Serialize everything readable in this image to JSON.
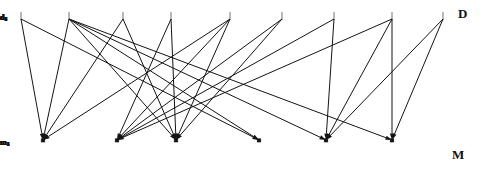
{
  "figure": {
    "type": "bipartite-graph",
    "background_color": "#ffffff",
    "line_color": "#141414",
    "width": 485,
    "height": 169
  },
  "set_labels": {
    "top": "D",
    "bottom": "M",
    "top_position": {
      "x": 458,
      "y": 7
    },
    "bottom_position": {
      "x": 452,
      "y": 148
    }
  },
  "top_nodes": [
    {
      "id": "d1",
      "letter": "d",
      "subscript": "1",
      "x": 21,
      "y": 16
    },
    {
      "id": "d2",
      "letter": "d",
      "subscript": "2",
      "x": 69,
      "y": 16
    },
    {
      "id": "d3",
      "letter": "d",
      "subscript": "3",
      "x": 123,
      "y": 16
    },
    {
      "id": "d4",
      "letter": "d",
      "subscript": "4",
      "x": 171,
      "y": 16
    },
    {
      "id": "d5",
      "letter": "d",
      "subscript": "5",
      "x": 230,
      "y": 16
    },
    {
      "id": "d6",
      "letter": "d",
      "subscript": "6",
      "x": 282,
      "y": 16
    },
    {
      "id": "d7",
      "letter": "d",
      "subscript": "7",
      "x": 334,
      "y": 16
    },
    {
      "id": "d8",
      "letter": "d",
      "subscript": "8",
      "x": 392,
      "y": 16
    },
    {
      "id": "d9",
      "letter": "d",
      "subscript": "9",
      "x": 443,
      "y": 16
    }
  ],
  "bottom_nodes": [
    {
      "id": "m1",
      "letter": "m",
      "subscript": "1",
      "x": 43,
      "y": 142
    },
    {
      "id": "m2",
      "letter": "m",
      "subscript": "2",
      "x": 117,
      "y": 142
    },
    {
      "id": "m3",
      "letter": "m",
      "subscript": "3",
      "x": 176,
      "y": 142
    },
    {
      "id": "m4",
      "letter": "m",
      "subscript": "4",
      "x": 259,
      "y": 142
    },
    {
      "id": "m5",
      "letter": "m",
      "subscript": "5",
      "x": 326,
      "y": 142
    },
    {
      "id": "m6",
      "letter": "m",
      "subscript": "6",
      "x": 392,
      "y": 142
    }
  ],
  "edges": [
    {
      "from": "d1",
      "to": "m1"
    },
    {
      "from": "d1",
      "to": "m4"
    },
    {
      "from": "d2",
      "to": "m1"
    },
    {
      "from": "d2",
      "to": "m3"
    },
    {
      "from": "d2",
      "to": "m4"
    },
    {
      "from": "d2",
      "to": "m5"
    },
    {
      "from": "d2",
      "to": "m6"
    },
    {
      "from": "d3",
      "to": "m1"
    },
    {
      "from": "d3",
      "to": "m3"
    },
    {
      "from": "d4",
      "to": "m2"
    },
    {
      "from": "d4",
      "to": "m3"
    },
    {
      "from": "d5",
      "to": "m1"
    },
    {
      "from": "d5",
      "to": "m2"
    },
    {
      "from": "d5",
      "to": "m3"
    },
    {
      "from": "d6",
      "to": "m2"
    },
    {
      "from": "d6",
      "to": "m3"
    },
    {
      "from": "d7",
      "to": "m2"
    },
    {
      "from": "d7",
      "to": "m5"
    },
    {
      "from": "d8",
      "to": "m2"
    },
    {
      "from": "d8",
      "to": "m5"
    },
    {
      "from": "d8",
      "to": "m6"
    },
    {
      "from": "d9",
      "to": "m5"
    },
    {
      "from": "d9",
      "to": "m6"
    }
  ]
}
